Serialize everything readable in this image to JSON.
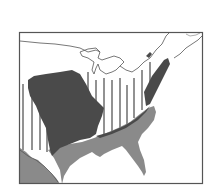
{
  "map": {
    "subject": "Eastern United States",
    "frame": {
      "x": 19,
      "y": 32,
      "width": 184,
      "height": 152
    },
    "colors": {
      "background": "#ffffff",
      "frame": "#555555",
      "boundary_line": "#555555",
      "dark_region": "#4a4a4a",
      "medium_region": "#8a8a8a",
      "hatch_lines": "#777777"
    },
    "legend": [],
    "regions": [
      {
        "name": "central-dark-region",
        "shade": "dark"
      },
      {
        "name": "atlantic-coast-dark-strip",
        "shade": "dark"
      },
      {
        "name": "gulf-southeast-coastal-region",
        "shade": "medium"
      },
      {
        "name": "texas-southwest-region",
        "shade": "medium"
      },
      {
        "name": "vertical-hatched-region",
        "shade": "hatched"
      }
    ]
  }
}
